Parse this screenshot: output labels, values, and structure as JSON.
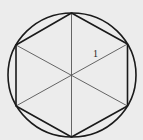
{
  "diagram": {
    "colors": {
      "background": "#ececec",
      "outline": "#1a1a1a",
      "diagonal": "#555555",
      "label": "#222222"
    },
    "circle": {
      "cx": 72,
      "cy": 75,
      "rx": 64,
      "ry": 62
    },
    "center": {
      "x": 71.5,
      "y": 75
    },
    "hexagon_vertices": [
      {
        "x": 71.5,
        "y": 13
      },
      {
        "x": 127.5,
        "y": 44
      },
      {
        "x": 127.5,
        "y": 106
      },
      {
        "x": 71.5,
        "y": 137
      },
      {
        "x": 16,
        "y": 106
      },
      {
        "x": 16,
        "y": 45
      }
    ],
    "side_label": {
      "text": "1",
      "x": 93,
      "y": 57
    }
  }
}
